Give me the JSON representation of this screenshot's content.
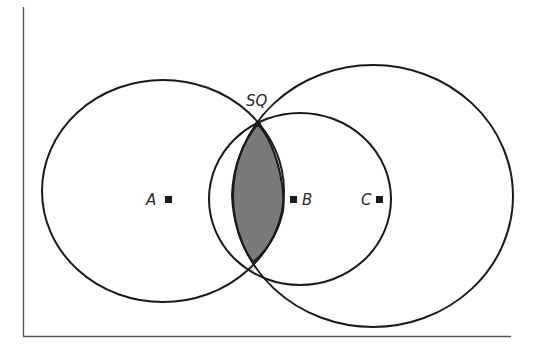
{
  "diagram": {
    "labels": {
      "sq": "SQ",
      "a": "A",
      "b": "B",
      "c": "C"
    },
    "colors": {
      "stroke": "#1a1a1a",
      "axis": "#555555",
      "lens_fill": "#7a7a7a",
      "background": "#ffffff"
    },
    "circles": [
      {
        "name": "A",
        "cx": 163,
        "cy": 191,
        "rx": 121,
        "ry": 111
      },
      {
        "name": "B",
        "cx": 300,
        "cy": 199,
        "rx": 91,
        "ry": 86
      },
      {
        "name": "C",
        "cx": 373,
        "cy": 196,
        "rx": 140,
        "ry": 131
      }
    ]
  }
}
